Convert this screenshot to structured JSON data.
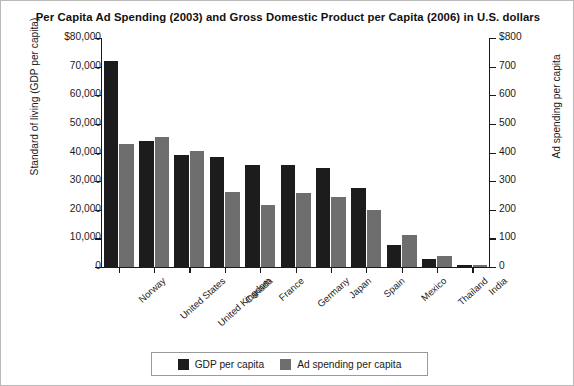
{
  "chart_data": {
    "type": "bar",
    "title": "Per Capita Ad Spending (2003) and Gross Domestic Product per Capita (2006) in U.S. dollars",
    "xlabel": "",
    "ylabel": "Standard of living (GDP per capita)",
    "y2label": "Ad spending per capita",
    "ylim": [
      0,
      80000
    ],
    "y2lim": [
      0,
      800
    ],
    "grid": false,
    "legend_position": "bottom",
    "categories": [
      "Norway",
      "United States",
      "United Kingdom",
      "Canada",
      "France",
      "Germany",
      "Japan",
      "Spain",
      "Mexico",
      "Thailand",
      "India"
    ],
    "ytick_labels": [
      "$80,000",
      "70,000",
      "60,000",
      "50,000",
      "40,000",
      "30,000",
      "20,000",
      "10,000",
      "0"
    ],
    "ytick_values": [
      80000,
      70000,
      60000,
      50000,
      40000,
      30000,
      20000,
      10000,
      0
    ],
    "y2tick_labels": [
      "$800",
      "700",
      "600",
      "500",
      "400",
      "300",
      "200",
      "100",
      "0"
    ],
    "y2tick_values": [
      800,
      700,
      600,
      500,
      400,
      300,
      200,
      100,
      0
    ],
    "series": [
      {
        "name": "GDP per capita",
        "axis": "left",
        "color": "#1c1c1c",
        "values": [
          72000,
          44000,
          39000,
          38500,
          35500,
          35500,
          34500,
          27500,
          7800,
          2900,
          800
        ]
      },
      {
        "name": "Ad spending per capita",
        "axis": "right",
        "color": "#6e6e6e",
        "values": [
          430,
          455,
          405,
          262,
          215,
          258,
          245,
          198,
          113,
          38,
          8
        ]
      }
    ]
  },
  "legend": {
    "items": [
      {
        "label": "GDP per capita",
        "color": "#1c1c1c"
      },
      {
        "label": "Ad spending per capita",
        "color": "#6e6e6e"
      }
    ]
  }
}
